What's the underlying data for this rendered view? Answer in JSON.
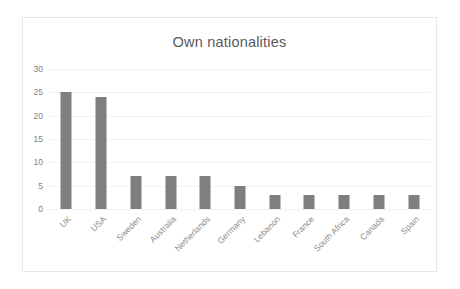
{
  "chart_data": {
    "type": "bar",
    "title": "Own nationalities",
    "xlabel": "",
    "ylabel": "",
    "categories": [
      "UK",
      "USA",
      "Sweden",
      "Australia",
      "Netherlands",
      "Germany",
      "Lebanon",
      "France",
      "South Africa",
      "Canada",
      "Spain"
    ],
    "values": [
      25,
      24,
      7,
      7,
      7,
      5,
      3,
      3,
      3,
      3,
      3
    ],
    "ylim": [
      0,
      30
    ],
    "yticks": [
      0,
      5,
      10,
      15,
      20,
      25,
      30
    ],
    "ytick_labels": [
      "0",
      "5",
      "10",
      "15",
      "20",
      "25",
      "30"
    ],
    "grid": true,
    "legend": false,
    "bar_color": "#7f7f7f",
    "gridline_color": "#f2f2f2",
    "title_color": "#595959",
    "tick_color": "#808080",
    "label_rotation": -45
  }
}
